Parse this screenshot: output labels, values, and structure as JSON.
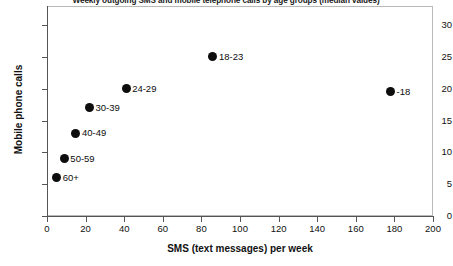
{
  "chart_data": {
    "type": "scatter",
    "title": "Weekly outgoing SMS and mobile telephone calls by age groups (median values)",
    "xlabel": "SMS (text messages) per week",
    "ylabel": "Mobile phone calls",
    "xlim": [
      0,
      200
    ],
    "ylim": [
      0,
      33
    ],
    "xticks": [
      0,
      20,
      40,
      60,
      80,
      100,
      120,
      140,
      160,
      180,
      200
    ],
    "yticks": [
      0,
      5,
      10,
      15,
      20,
      25,
      30
    ],
    "grid": false,
    "legend": "none",
    "marker": "filled-circle",
    "marker_color": "#0d0d0d",
    "points": [
      {
        "label": "-18",
        "x": 178,
        "y": 19.5,
        "label_side": "right"
      },
      {
        "label": "18-23",
        "x": 86,
        "y": 25,
        "label_side": "right"
      },
      {
        "label": "24-29",
        "x": 41,
        "y": 20,
        "label_side": "right"
      },
      {
        "label": "30-39",
        "x": 22,
        "y": 17,
        "label_side": "right"
      },
      {
        "label": "40-49",
        "x": 15,
        "y": 13,
        "label_side": "right"
      },
      {
        "label": "50-59",
        "x": 9,
        "y": 9,
        "label_side": "right"
      },
      {
        "label": "60+",
        "x": 5,
        "y": 6,
        "label_side": "right"
      }
    ]
  }
}
